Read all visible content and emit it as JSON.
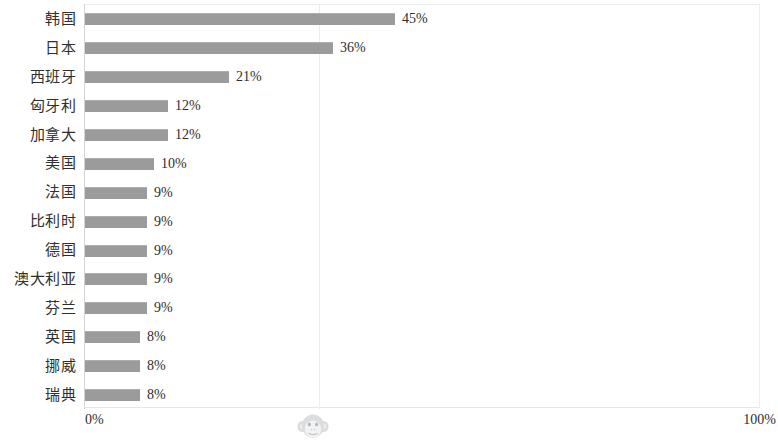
{
  "chart_data": {
    "type": "bar",
    "orientation": "horizontal",
    "title": "",
    "subtitle": "",
    "xlabel": "",
    "ylabel": "",
    "xlim": [
      0,
      100
    ],
    "grid": true,
    "legend": null,
    "value_suffix": "%",
    "categories": [
      "韩国",
      "日本",
      "西班牙",
      "匈牙利",
      "加拿大",
      "美国",
      "法国",
      "比利时",
      "德国",
      "澳大利亚",
      "芬兰",
      "英国",
      "挪威",
      "瑞典"
    ],
    "values": [
      45,
      36,
      21,
      12,
      12,
      10,
      9,
      9,
      9,
      9,
      9,
      8,
      8,
      8
    ],
    "value_labels": [
      "45%",
      "36%",
      "21%",
      "12%",
      "12%",
      "10%",
      "9%",
      "9%",
      "9%",
      "9%",
      "9%",
      "8%",
      "8%",
      "8%"
    ],
    "axis_ticks": [
      "0%",
      "100%"
    ],
    "bar_color": "#9b9b9b",
    "gridline_percent": 34
  },
  "axis": {
    "min_label": "0%",
    "max_label": "100%"
  },
  "watermark": {
    "name": "monkey-face-watermark"
  }
}
